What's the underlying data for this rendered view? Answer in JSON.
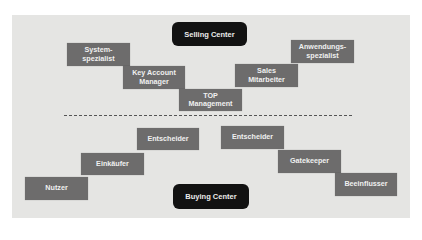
{
  "selling_center": {
    "title": "Selling Center",
    "roles": [
      {
        "label": "System-\nspezialist"
      },
      {
        "label": "Key Account\nManager"
      },
      {
        "label": "TOP\nManagement"
      },
      {
        "label": "Sales\nMitarbeiter"
      },
      {
        "label": "Anwendungs-\nspezialist"
      }
    ]
  },
  "buying_center": {
    "title": "Buying Center",
    "roles": [
      {
        "label": "Nutzer"
      },
      {
        "label": "Einkäufer"
      },
      {
        "label": "Entscheider"
      },
      {
        "label": "Entscheider"
      },
      {
        "label": "Gatekeeper"
      },
      {
        "label": "Beeinflusser"
      }
    ]
  },
  "colors": {
    "panel": "#e5e5e3",
    "role_box": "#6d6c6c",
    "center_pill": "#121212"
  }
}
